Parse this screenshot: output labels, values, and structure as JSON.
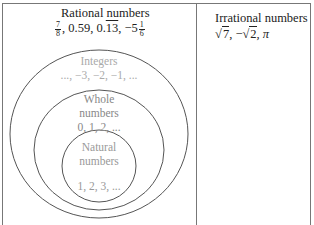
{
  "rational": {
    "title": "Rational numbers",
    "ex1_num": "7",
    "ex1_den": "8",
    "ex2": ", 0.59, 0.",
    "ex3_repeat": "13",
    "ex4": ", −5",
    "ex5_num": "1",
    "ex5_den": "6"
  },
  "irrational": {
    "title": "Irrational numbers",
    "sqrt_sym": "√",
    "rad1": "7",
    "sep1": ", −",
    "rad2": "2",
    "tail": ", π"
  },
  "sets": {
    "integers": {
      "label": "Integers",
      "examples": "..., −3, −2, −1, ..."
    },
    "whole": {
      "label_line1": "Whole",
      "label_line2": "numbers",
      "examples": "0, 1, 2, ..."
    },
    "natural": {
      "label_line1": "Natural",
      "label_line2": "numbers",
      "examples": "1, 2, 3, ..."
    }
  },
  "colors": {
    "border": "#777777",
    "circle_stroke": "#555555",
    "text_dark": "#222222",
    "text_integers": "#aaaaaa",
    "text_whole": "#888888"
  }
}
